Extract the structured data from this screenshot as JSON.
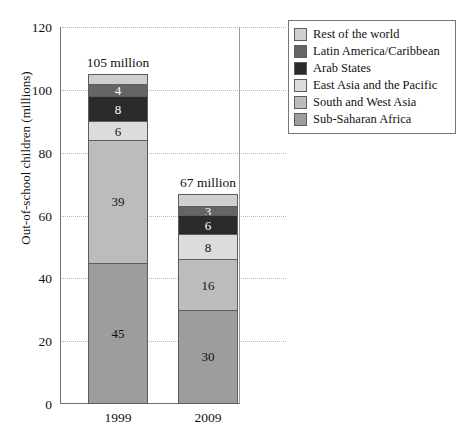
{
  "chart_data": {
    "type": "bar",
    "subtype": "stacked-bar",
    "title": "",
    "xlabel": "",
    "ylabel": "Out-of-school children (millions)",
    "ylim": [
      0,
      120
    ],
    "yticks": [
      0,
      20,
      40,
      60,
      80,
      100,
      120
    ],
    "ytick_labels": [
      "0",
      "20",
      "40",
      "60",
      "80",
      "100",
      "120"
    ],
    "grid": "horizontal-dotted",
    "legend_position": "top-right",
    "categories": [
      "1999",
      "2009"
    ],
    "bar_totals": [
      "105 million",
      "67 million"
    ],
    "bar_total_values": [
      105,
      67
    ],
    "stack_order_bottom_to_top": [
      "Sub-Saharan Africa",
      "South and West Asia",
      "East Asia and the Pacific",
      "Arab States",
      "Latin America/Caribbean",
      "Rest of the world"
    ],
    "series": [
      {
        "name": "Sub-Saharan Africa",
        "color": "#9d9d9d",
        "values": [
          45,
          30
        ],
        "labels": [
          "45",
          "30"
        ],
        "text_color": "#111111"
      },
      {
        "name": "South and West Asia",
        "color": "#bcbcbc",
        "values": [
          39,
          16
        ],
        "labels": [
          "39",
          "16"
        ],
        "text_color": "#111111"
      },
      {
        "name": "East Asia and the Pacific",
        "color": "#dcdcdc",
        "values": [
          6,
          8
        ],
        "labels": [
          "6",
          "8"
        ],
        "text_color": "#111111"
      },
      {
        "name": "Arab States",
        "color": "#2b2b2b",
        "values": [
          8,
          6
        ],
        "labels": [
          "8",
          "6"
        ],
        "text_color": "#ffffff"
      },
      {
        "name": "Latin America/Caribbean",
        "color": "#656565",
        "values": [
          4,
          3
        ],
        "labels": [
          "4",
          "3"
        ],
        "text_color": "#ffffff"
      },
      {
        "name": "Rest of the world",
        "color": "#cfcfcf",
        "values": [
          3,
          4
        ],
        "labels": [
          "",
          ""
        ],
        "text_color": "#111111"
      }
    ]
  },
  "legend": {
    "entries": [
      {
        "label": "Rest of the world",
        "color": "#cfcfcf"
      },
      {
        "label": "Latin America/Caribbean",
        "color": "#656565"
      },
      {
        "label": "Arab States",
        "color": "#2b2b2b"
      },
      {
        "label": "East Asia and the Pacific",
        "color": "#dcdcdc"
      },
      {
        "label": "South and West Asia",
        "color": "#bcbcbc"
      },
      {
        "label": "Sub-Saharan Africa",
        "color": "#9d9d9d"
      }
    ]
  },
  "axes": {
    "y_title": "Out-of-school children (millions)",
    "y_tick_labels": [
      "120",
      "100",
      "80",
      "60",
      "40",
      "20",
      "0"
    ],
    "x_tick_labels": [
      "1999",
      "2009"
    ]
  }
}
